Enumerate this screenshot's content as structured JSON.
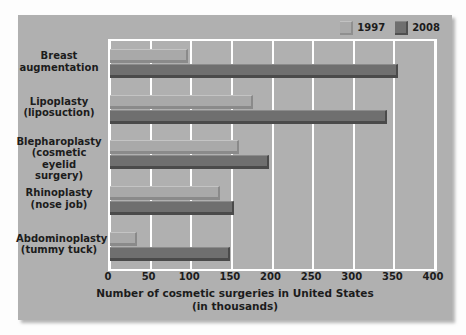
{
  "chart_data": {
    "type": "bar",
    "orientation": "horizontal",
    "title": "",
    "xlabel": "Number of cosmetic surgeries in United States",
    "xlabel_line2": "(in thousands)",
    "ylabel": "",
    "xlim": [
      0,
      400
    ],
    "xticks": [
      0,
      50,
      100,
      150,
      200,
      250,
      300,
      350,
      400
    ],
    "xticklabels": [
      "0",
      "50",
      "100",
      "150",
      "200",
      "250",
      "300",
      "350",
      "400"
    ],
    "grid": "vertical-only",
    "legend_position": "top-right",
    "categories": [
      "Breast augmentation",
      "Lipoplasty (liposuction)",
      "Blepharoplasty (cosmetic eyelid surgery)",
      "Rhinoplasty (nose job)",
      "Abdominoplasty (tummy tuck)"
    ],
    "category_lines": [
      [
        "Breast",
        "augmentation"
      ],
      [
        "Lipoplasty",
        "(liposuction)"
      ],
      [
        "Blepharoplasty",
        "(cosmetic eyelid",
        "surgery)"
      ],
      [
        "Rhinoplasty",
        "(nose job)"
      ],
      [
        "Abdominoplasty",
        "(tummy tuck)"
      ]
    ],
    "series": [
      {
        "name": "1997",
        "color": "#a9a9a9",
        "values": [
          96,
          176,
          159,
          135,
          33
        ]
      },
      {
        "name": "2008",
        "color": "#6f6f6f",
        "values": [
          355,
          341,
          196,
          152,
          148
        ]
      }
    ]
  },
  "legend": {
    "entries": [
      {
        "label": "1997",
        "swatch": "light"
      },
      {
        "label": "2008",
        "swatch": "dark"
      }
    ]
  },
  "colors": {
    "figure_background": "#fdfdfd",
    "panel_background": "#b0b0b0",
    "gridline": "#ffffff",
    "text": "#1c1c1c",
    "series_1997": "#a9a9a9",
    "series_2008": "#6f6f6f"
  }
}
